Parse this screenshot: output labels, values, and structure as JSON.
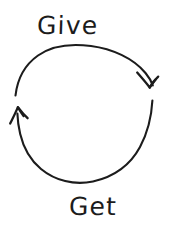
{
  "diagram": {
    "type": "cycle",
    "style": "hand-drawn sketch",
    "background_color": "#ffffff",
    "ink_color": "#1c1c1c",
    "direction": "clockwise",
    "nodes": [
      {
        "id": "give",
        "label": "Give",
        "position": "top"
      },
      {
        "id": "get",
        "label": "Get",
        "position": "bottom"
      }
    ],
    "arrows": [
      {
        "id": "give-to-get",
        "from": "give",
        "to": "get",
        "description": "upper arc sweeping left to right, arrowhead pointing down at right side",
        "arrowhead": "down-right"
      },
      {
        "id": "get-to-give",
        "from": "get",
        "to": "give",
        "description": "lower arc sweeping right to left, arrowhead pointing up at left side",
        "arrowhead": "up-left"
      }
    ]
  }
}
